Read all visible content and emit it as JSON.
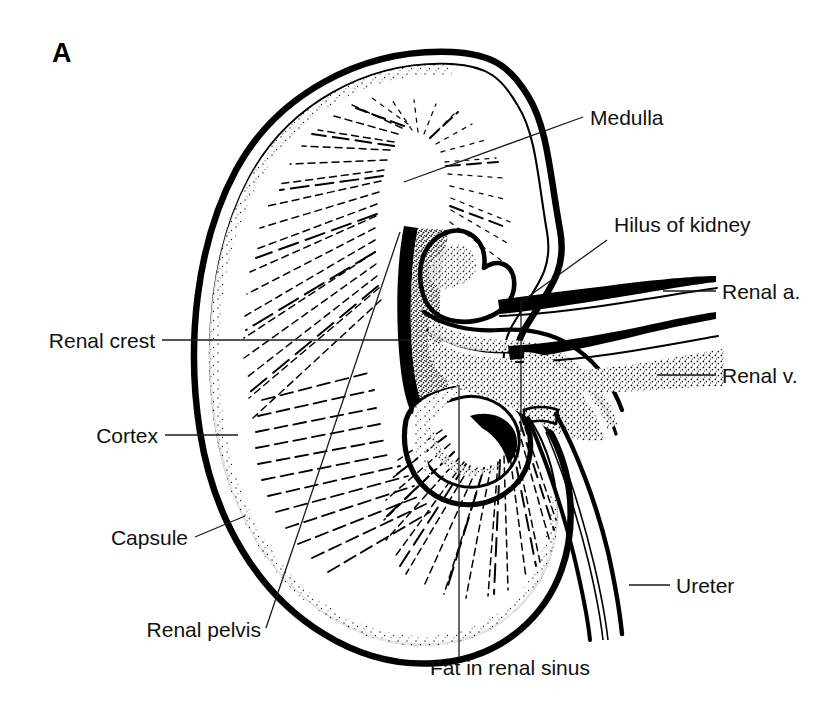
{
  "figure": {
    "panel_letter": "A",
    "background_color": "#ffffff",
    "ink_color": "#000000"
  },
  "annotations": [
    {
      "id": "medulla",
      "label": "Medulla",
      "side": "right",
      "text_x": 590,
      "text_y": 125,
      "anchor": "start",
      "leader": "M 583 117 L 404 182"
    },
    {
      "id": "hilus-of-kidney",
      "label": "Hilus of kidney",
      "side": "right",
      "text_x": 614,
      "text_y": 232,
      "anchor": "start",
      "leader": "M 607 240 L 521 302"
    },
    {
      "id": "renal-a",
      "label": "Renal a.",
      "side": "right",
      "text_x": 722,
      "text_y": 299,
      "anchor": "start",
      "leader": "M 716 291 L 663 291"
    },
    {
      "id": "renal-v",
      "label": "Renal v.",
      "side": "right",
      "text_x": 722,
      "text_y": 383,
      "anchor": "start",
      "leader": "M 716 375 L 657 375"
    },
    {
      "id": "ureter",
      "label": "Ureter",
      "side": "right",
      "text_x": 676,
      "text_y": 593,
      "anchor": "start",
      "leader": "M 670 585 L 629 585"
    },
    {
      "id": "renal-crest",
      "label": "Renal crest",
      "side": "left",
      "text_x": 155,
      "text_y": 348,
      "anchor": "end",
      "leader": "M 162 340 L 411 340"
    },
    {
      "id": "cortex",
      "label": "Cortex",
      "side": "left",
      "text_x": 158,
      "text_y": 443,
      "anchor": "end",
      "leader": "M 165 435 L 238 435"
    },
    {
      "id": "capsule",
      "label": "Capsule",
      "side": "left",
      "text_x": 188,
      "text_y": 545,
      "anchor": "end",
      "leader": "M 195 537 L 245 516"
    },
    {
      "id": "renal-pelvis",
      "label": "Renal pelvis",
      "side": "left",
      "text_x": 261,
      "text_y": 637,
      "anchor": "end",
      "leader": "M 266 628 L 400 232"
    },
    {
      "id": "fat-in-renal-sinus",
      "label": "Fat in renal sinus",
      "side": "bottom",
      "text_x": 430,
      "text_y": 675,
      "anchor": "start",
      "leader": "M 459 659 L 459 385"
    }
  ],
  "structures": {
    "capsule_outer": "Outer fibrous capsule — bold double contour around the bean-shaped organ",
    "cortex_band": "Pale outer zone beneath the capsule",
    "medulla_rays": "Radiating stippled medullary pyramids converging on the sinus",
    "renal_crest": "Central ridge projecting into the sinus",
    "renal_pelvis": "Funnel-shaped collecting chamber continuous with the ureter",
    "renal_sinus_fat": "Stippled fat filling the sinus cavity",
    "renal_artery": "Upper vessel entering the hilus",
    "renal_vein": "Lower vessel leaving the hilus",
    "ureter": "Tube descending from the pelvis at lower right"
  }
}
